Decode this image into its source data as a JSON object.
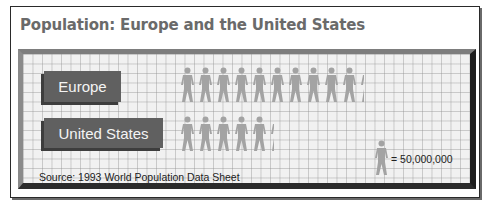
{
  "title": "Population: Europe and the United States",
  "rows": [
    {
      "label": "Europe",
      "full_icons": 10,
      "partial_fraction": 0.3
    },
    {
      "label": "United States",
      "full_icons": 5,
      "partial_fraction": 0.3
    }
  ],
  "legend": {
    "icon": "person-icon",
    "text": "= 50,000,000"
  },
  "source": "Source: 1993 World Population Data Sheet",
  "colors": {
    "icon": "#a3a3a3",
    "label_bg": "#606060",
    "grid_bg": "#f1f1f1",
    "title": "#6a6a6a"
  },
  "chart_data": {
    "type": "bar",
    "subtype": "pictograph",
    "title": "Population: Europe and the United States",
    "categories": [
      "Europe",
      "United States"
    ],
    "values": [
      515000000,
      265000000
    ],
    "icon_counts": [
      10.3,
      5.3
    ],
    "unit_per_icon": 50000000,
    "legend": "= 50,000,000",
    "annotation": "Source: 1993 World Population Data Sheet",
    "xlabel": "",
    "ylabel": "",
    "grid": true
  }
}
